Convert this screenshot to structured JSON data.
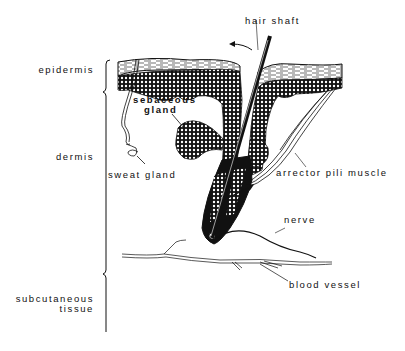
{
  "diagram": {
    "layers": [
      {
        "id": "epidermis",
        "label": "epidermis"
      },
      {
        "id": "dermis",
        "label": "dermis"
      },
      {
        "id": "subcutaneous",
        "label": "subcutaneous\ntissue",
        "line1": "subcutaneous",
        "line2": "tissue"
      }
    ],
    "structures": {
      "hair_shaft": "hair shaft",
      "sebaceous_gland_line1": "sebaceous",
      "sebaceous_gland_line2": "gland",
      "sweat_gland": "sweat gland",
      "arrector_pili": "arrector pili muscle",
      "nerve": "nerve",
      "blood_vessel": "blood vessel"
    },
    "colors": {
      "ink": "#111111",
      "background": "#ffffff"
    }
  }
}
